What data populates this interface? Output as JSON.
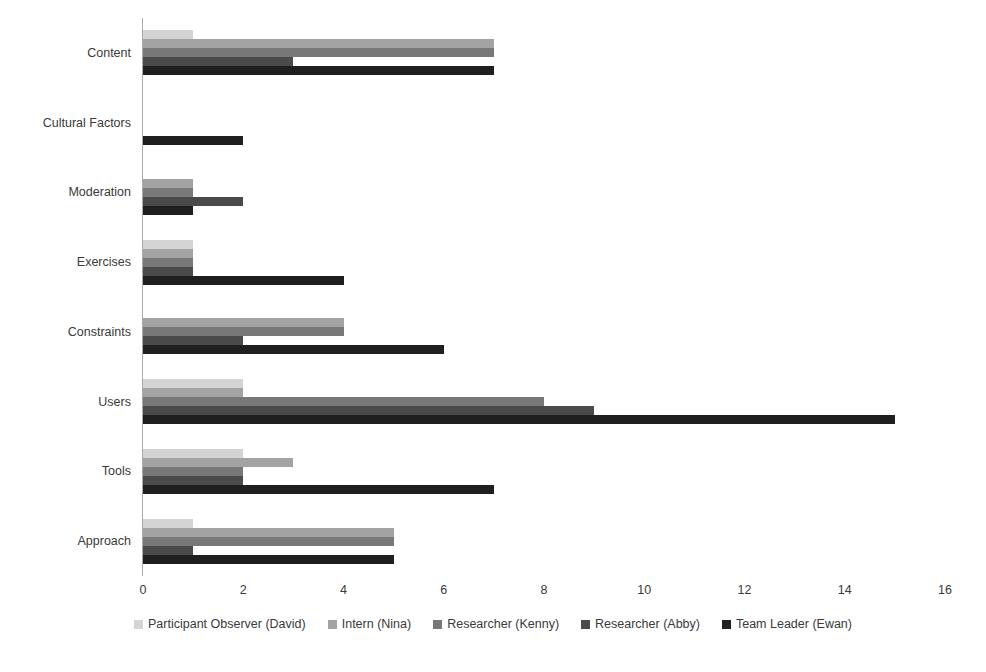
{
  "chart_data": {
    "type": "bar",
    "orientation": "horizontal",
    "title": "",
    "xlabel": "",
    "ylabel": "",
    "xlim": [
      0,
      16
    ],
    "xticks": [
      0,
      2,
      4,
      6,
      8,
      10,
      12,
      14,
      16
    ],
    "xtick_labels": [
      "0",
      "2",
      "4",
      "6",
      "8",
      "10",
      "12",
      "14",
      "16"
    ],
    "grid": false,
    "legend_position": "bottom",
    "categories": [
      "Content",
      "Cultural Factors",
      "Moderation",
      "Exercises",
      "Constraints",
      "Users",
      "Tools",
      "Approach"
    ],
    "series": [
      {
        "name": "Participant Observer (David)",
        "color": "#d4d4d4",
        "values": [
          1,
          0,
          0,
          1,
          0,
          2,
          2,
          1
        ]
      },
      {
        "name": "Intern (Nina)",
        "color": "#a3a3a3",
        "values": [
          7,
          0,
          1,
          1,
          4,
          2,
          3,
          5
        ]
      },
      {
        "name": "Researcher (Kenny)",
        "color": "#787878",
        "values": [
          7,
          0,
          1,
          1,
          4,
          8,
          2,
          5
        ]
      },
      {
        "name": "Researcher (Abby)",
        "color": "#4a4a4a",
        "values": [
          3,
          0,
          2,
          1,
          2,
          9,
          2,
          1
        ]
      },
      {
        "name": "Team Leader (Ewan)",
        "color": "#1f1f1f",
        "values": [
          7,
          2,
          1,
          4,
          6,
          15,
          7,
          5
        ]
      }
    ]
  },
  "axis": {
    "line_color": "#a9a9a9"
  }
}
